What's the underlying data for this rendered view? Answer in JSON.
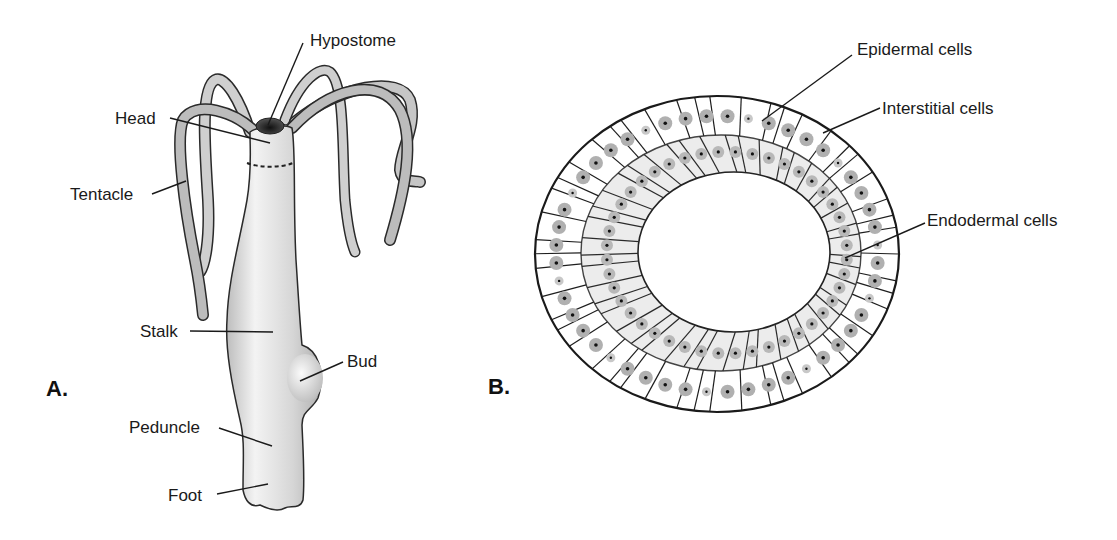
{
  "figure": {
    "panels": [
      {
        "id": "A",
        "label": "A.",
        "subject": "Hydra whole organism",
        "annotations": [
          {
            "text": "Hypostome"
          },
          {
            "text": "Head"
          },
          {
            "text": "Tentacle"
          },
          {
            "text": "Stalk"
          },
          {
            "text": "Bud"
          },
          {
            "text": "Peduncle"
          },
          {
            "text": "Foot"
          }
        ]
      },
      {
        "id": "B",
        "label": "B.",
        "subject": "Hydra body cross-section",
        "annotations": [
          {
            "text": "Epidermal cells"
          },
          {
            "text": "Interstitial cells"
          },
          {
            "text": "Endodermal cells"
          }
        ]
      }
    ],
    "colors": {
      "outline": "#2a2a2a",
      "body_fill": "#d4d4d4",
      "body_highlight": "#f2f2f2",
      "tentacle_fill": "#c2c2c2",
      "hypostome": "#2b2b2b",
      "nucleus_halo": "#a8a8a8",
      "nucleolus": "#111111",
      "endoderm_fill": "#ececec",
      "background": "#ffffff"
    }
  }
}
